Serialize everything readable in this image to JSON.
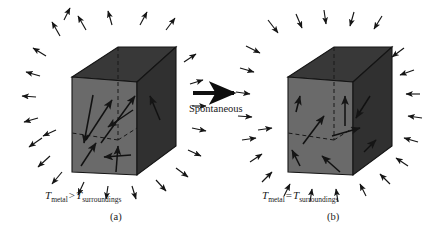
{
  "figure": {
    "background_color": "#ffffff",
    "width": 438,
    "height": 242
  },
  "transition": {
    "arrow_icon": "right-arrow-icon",
    "caption": "Spontaneous",
    "color": "#111111"
  },
  "panels": [
    {
      "id": "a",
      "panel_label": "(a)",
      "temperature_symbol": "T",
      "subject_subscript": "metal",
      "relation": ">",
      "reference_subscript": "surroundings",
      "cube": {
        "top_face_color": "#383838",
        "front_face_color": "#6a6a6a",
        "right_face_color": "#303030",
        "edge_color": "#141414"
      },
      "internal_arrow_count": 8,
      "external_arrow_count": 24,
      "external_arrow_direction": "outward"
    },
    {
      "id": "b",
      "panel_label": "(b)",
      "temperature_symbol": "T",
      "subject_subscript": "metal",
      "relation": "=",
      "reference_subscript": "surroundings",
      "cube": {
        "top_face_color": "#383838",
        "front_face_color": "#6a6a6a",
        "right_face_color": "#303030",
        "edge_color": "#141414"
      },
      "internal_arrow_count": 8,
      "external_arrow_count": 24,
      "external_arrow_direction": "inward"
    }
  ]
}
